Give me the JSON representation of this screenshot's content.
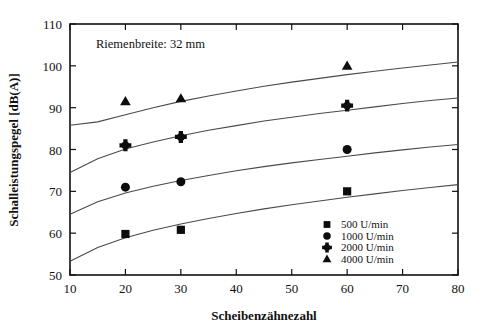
{
  "chart_data": {
    "type": "scatter",
    "title": "",
    "annotation": "Riemenbreite: 32 mm",
    "xlabel": "Scheibenzähnezahl",
    "ylabel": "Schalleistungspegel [dB(A)]",
    "xlim": [
      10,
      80
    ],
    "ylim": [
      50,
      110
    ],
    "xticks": [
      10,
      20,
      30,
      40,
      50,
      60,
      70,
      80
    ],
    "yticks": [
      50,
      60,
      70,
      80,
      90,
      100,
      110
    ],
    "grid": false,
    "legend_position": "bottom-right",
    "marker_color": "#0d0d0d",
    "curve_color": "#4a4a4a",
    "series": [
      {
        "name": "500 U/min",
        "marker": "square",
        "x": [
          20,
          30,
          60
        ],
        "y": [
          59.8,
          60.8,
          70.0
        ],
        "fit_curve": {
          "x": [
            10,
            15,
            20,
            25,
            30,
            35,
            40,
            45,
            50,
            55,
            60,
            65,
            70,
            75,
            80
          ],
          "y": [
            53.3,
            56.6,
            58.9,
            60.7,
            62.2,
            63.5,
            64.7,
            65.8,
            66.8,
            67.7,
            68.6,
            69.4,
            70.2,
            70.9,
            71.6
          ]
        }
      },
      {
        "name": "1000 U/min",
        "marker": "circle",
        "x": [
          20,
          30,
          60
        ],
        "y": [
          71.0,
          72.3,
          80.0
        ],
        "fit_curve": {
          "x": [
            10,
            15,
            20,
            25,
            30,
            35,
            40,
            45,
            50,
            55,
            60,
            65,
            70,
            75,
            80
          ],
          "y": [
            64.5,
            67.5,
            69.6,
            71.2,
            72.6,
            73.8,
            74.9,
            75.9,
            76.8,
            77.6,
            78.4,
            79.2,
            79.9,
            80.6,
            81.2
          ]
        }
      },
      {
        "name": "2000 U/min",
        "marker": "plus-diamond",
        "x": [
          20,
          30,
          60
        ],
        "y": [
          81.0,
          83.0,
          90.5
        ],
        "fit_curve": {
          "x": [
            10,
            15,
            20,
            25,
            30,
            35,
            40,
            45,
            50,
            55,
            60,
            65,
            70,
            75,
            80
          ],
          "y": [
            74.5,
            77.8,
            80.1,
            81.8,
            83.3,
            84.6,
            85.7,
            86.8,
            87.7,
            88.6,
            89.4,
            90.2,
            91.0,
            91.7,
            92.3
          ]
        }
      },
      {
        "name": "4000 U/min",
        "marker": "triangle",
        "x": [
          20,
          30,
          60
        ],
        "y": [
          91.5,
          92.2,
          100.0
        ],
        "fit_curve": {
          "x": [
            10,
            15,
            20,
            25,
            30,
            35,
            40,
            45,
            50,
            55,
            60,
            65,
            70,
            75,
            80
          ],
          "y": [
            85.8,
            86.6,
            88.3,
            90.0,
            91.5,
            92.8,
            94.0,
            95.1,
            96.1,
            97.0,
            97.9,
            98.7,
            99.5,
            100.2,
            100.9
          ]
        }
      }
    ]
  },
  "legend": {
    "entries": [
      {
        "marker": "square",
        "label": "500 U/min"
      },
      {
        "marker": "circle",
        "label": "1000 U/min"
      },
      {
        "marker": "plus-diamond",
        "label": "2000 U/min"
      },
      {
        "marker": "triangle",
        "label": "4000 U/min"
      }
    ]
  }
}
